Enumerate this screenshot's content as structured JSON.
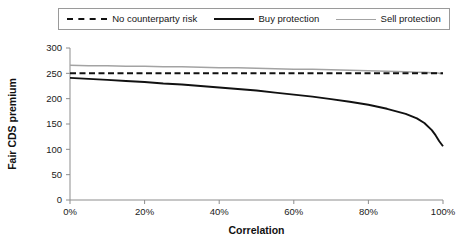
{
  "legend": {
    "position": "top",
    "entries": [
      {
        "label": "No counterparty risk",
        "style": "dashed",
        "color": "#111111"
      },
      {
        "label": "Buy protection",
        "style": "solid",
        "color": "#111111"
      },
      {
        "label": "Sell protection",
        "style": "solid",
        "color": "#a3a3a3"
      }
    ]
  },
  "chart_data": {
    "type": "line",
    "title": "",
    "xlabel": "Correlation",
    "ylabel": "Fair CDS premium",
    "xlim": [
      0,
      100
    ],
    "ylim": [
      0,
      300
    ],
    "grid": false,
    "xticks": [
      0,
      20,
      40,
      60,
      80,
      100
    ],
    "xtick_labels": [
      "0%",
      "20%",
      "40%",
      "60%",
      "80%",
      "100%"
    ],
    "yticks": [
      0,
      50,
      100,
      150,
      200,
      250,
      300
    ],
    "ytick_labels": [
      "0",
      "50",
      "100",
      "150",
      "200",
      "250",
      "300"
    ],
    "x": [
      0,
      5,
      10,
      15,
      20,
      25,
      30,
      35,
      40,
      45,
      50,
      55,
      60,
      65,
      70,
      75,
      80,
      85,
      90,
      93,
      95,
      97,
      98,
      99,
      100
    ],
    "series": [
      {
        "name": "No counterparty risk",
        "style": "dashed",
        "color": "#111111",
        "values": [
          250,
          250,
          250,
          250,
          250,
          250,
          250,
          250,
          250,
          250,
          250,
          250,
          250,
          250,
          250,
          250,
          250,
          250,
          250,
          250,
          250,
          250,
          250,
          250,
          250
        ]
      },
      {
        "name": "Buy protection",
        "style": "solid",
        "color": "#111111",
        "values": [
          241,
          239,
          237,
          235,
          233,
          230,
          228,
          225,
          222,
          219,
          216,
          212,
          208,
          204,
          199,
          194,
          188,
          180,
          170,
          161,
          152,
          138,
          128,
          116,
          106
        ]
      },
      {
        "name": "Sell protection",
        "style": "solid",
        "color": "#a3a3a3",
        "values": [
          266,
          265,
          265,
          264,
          264,
          263,
          263,
          262,
          261,
          261,
          260,
          259,
          258,
          258,
          257,
          256,
          255,
          254,
          253,
          252,
          252,
          251,
          251,
          250,
          250
        ]
      }
    ]
  }
}
